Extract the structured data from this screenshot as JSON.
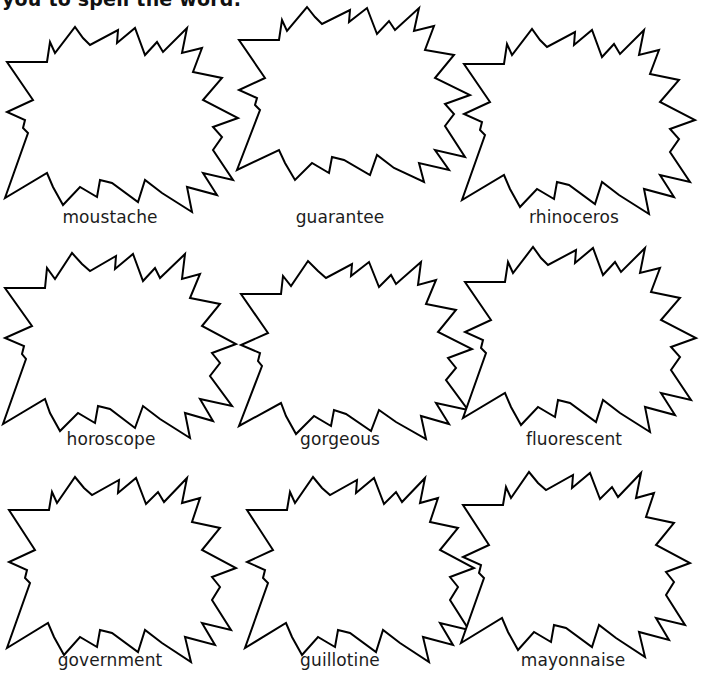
{
  "header": {
    "instruction_text": "you to spell the word."
  },
  "grid": {
    "rows": 3,
    "columns": 3,
    "cells": [
      {
        "word": "moustache"
      },
      {
        "word": "guarantee"
      },
      {
        "word": "rhinoceros"
      },
      {
        "word": "horoscope"
      },
      {
        "word": "gorgeous"
      },
      {
        "word": "fluorescent"
      },
      {
        "word": "government"
      },
      {
        "word": "guillotine"
      },
      {
        "word": "mayonnaise"
      }
    ]
  },
  "icons": {
    "burst_shape": "starburst-outline-icon"
  },
  "colors": {
    "background": "#ffffff",
    "outline": "#000000",
    "text": "#1c1c1c"
  }
}
